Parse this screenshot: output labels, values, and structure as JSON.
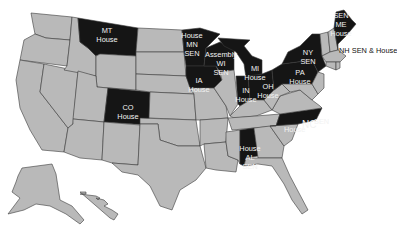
{
  "map": {
    "colors": {
      "selected": "#151515",
      "unselected": "#b9b9b9",
      "border": "#3a3a3a",
      "label_on_dark": "#f2f2f2",
      "label_outside": "#111111"
    },
    "highlighted_states": [
      {
        "state": "MT",
        "lines": [
          "MT",
          "House"
        ]
      },
      {
        "state": "CO",
        "lines": [
          "CO",
          "House"
        ]
      },
      {
        "state": "MN",
        "lines": [
          "House",
          "MN",
          "SEN"
        ]
      },
      {
        "state": "WI",
        "lines": [
          "Assembly",
          "WI",
          "SEN"
        ]
      },
      {
        "state": "IA",
        "lines": [
          "IA",
          "House"
        ]
      },
      {
        "state": "MI",
        "lines": [
          "MI",
          "House"
        ]
      },
      {
        "state": "IN",
        "lines": [
          "IN",
          "House"
        ]
      },
      {
        "state": "OH",
        "lines": [
          "OH",
          "House"
        ]
      },
      {
        "state": "PA",
        "lines": [
          "PA",
          "House"
        ]
      },
      {
        "state": "NY",
        "lines": [
          "NY",
          "SEN"
        ]
      },
      {
        "state": "ME",
        "lines": [
          "SEN",
          "ME",
          "House"
        ]
      },
      {
        "state": "NH",
        "lines": [
          "NH SEN & House"
        ]
      },
      {
        "state": "NC",
        "lines": [
          "House",
          "NC",
          "SEN"
        ]
      },
      {
        "state": "AL",
        "lines": [
          "House",
          "AL",
          "SEN"
        ]
      }
    ],
    "labels": {
      "mt": {
        "l1": "MT",
        "l2": "House"
      },
      "co": {
        "l1": "CO",
        "l2": "House"
      },
      "mn": {
        "l1": "House",
        "l2": "MN",
        "l3": "SEN"
      },
      "wi": {
        "l1": "Assembly",
        "l2": "WI",
        "l3": "SEN"
      },
      "ia": {
        "l1": "IA",
        "l2": "House"
      },
      "mi": {
        "l1": "MI",
        "l2": "House"
      },
      "in": {
        "l1": "IN",
        "l2": "House"
      },
      "oh": {
        "l1": "OH",
        "l2": "House"
      },
      "pa": {
        "l1": "PA",
        "l2": "House"
      },
      "ny": {
        "l1": "NY",
        "l2": "SEN"
      },
      "me": {
        "l1": "SEN",
        "l2": "ME",
        "l3": "House"
      },
      "nh": {
        "l1": "NH SEN & House"
      },
      "nc": {
        "l1": "House",
        "l2": "NC",
        "l3": "SEN"
      },
      "al": {
        "l1": "House",
        "l2": "AL",
        "l3": "SEN"
      }
    }
  }
}
